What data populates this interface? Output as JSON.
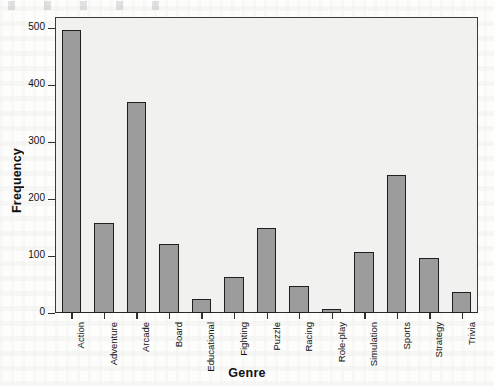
{
  "chart_data": {
    "type": "bar",
    "title": "",
    "subtitle": "",
    "xlabel": "Genre",
    "ylabel": "Frequency",
    "categories": [
      "Action",
      "Adventure",
      "Arcade",
      "Board",
      "Educational",
      "Fighting",
      "Puzzle",
      "Racing",
      "Role-play",
      "Simulation",
      "Sports",
      "Strategy",
      "Trivia"
    ],
    "values": [
      497,
      159,
      370,
      121,
      24,
      63,
      150,
      47,
      7,
      108,
      243,
      96,
      37
    ],
    "ylim": [
      0,
      520
    ],
    "yticks": [
      0,
      100,
      200,
      300,
      400,
      500
    ],
    "ytick_labels": [
      "0",
      "100",
      "200",
      "300",
      "400",
      "500"
    ],
    "grid": false,
    "legend": "none",
    "bar_fill_color": "#9c9c9c",
    "bar_edge_color": "#1f1f1f",
    "plot_background_color": "#f1f1ef",
    "axis_color": "#2f2f2f"
  }
}
